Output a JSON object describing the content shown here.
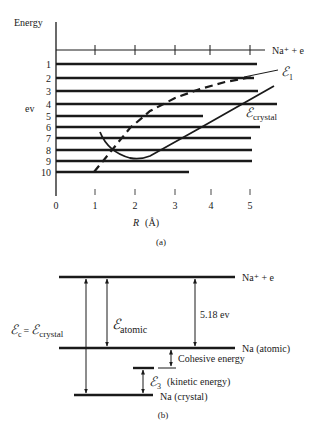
{
  "panel_a": {
    "y_axis_label": "Energy",
    "y_unit_label": "ev",
    "x_axis_label": "R",
    "x_axis_unit": "(Å)",
    "caption": "(a)",
    "top_level_label": "Na⁺ + e",
    "levels": [
      {
        "label": "1",
        "y": 64,
        "x_end": 257
      },
      {
        "label": "2",
        "y": 78,
        "x_end": 254
      },
      {
        "label": "3",
        "y": 91,
        "x_end": 258
      },
      {
        "label": "4",
        "y": 104,
        "x_end": 277
      },
      {
        "label": "5",
        "y": 116,
        "x_end": 203
      },
      {
        "label": "6",
        "y": 127,
        "x_end": 260
      },
      {
        "label": "7",
        "y": 138,
        "x_end": 251
      },
      {
        "label": "8",
        "y": 150,
        "x_end": 252
      },
      {
        "label": "9",
        "y": 161,
        "x_end": 252
      },
      {
        "label": "10",
        "y": 172,
        "x_end": 189
      }
    ],
    "x_ticks": [
      "0",
      "1",
      "2",
      "3",
      "4",
      "5"
    ],
    "curve_e1_label": "ℰ",
    "curve_e1_sub": "1",
    "curve_crystal_label": "ℰ",
    "curve_crystal_sub": "crystal"
  },
  "panel_b": {
    "caption": "(b)",
    "level_top": "Na⁺ + e",
    "level_atomic": "Na (atomic)",
    "level_crystal": "Na (crystal)",
    "ionization_value": "5.18 ev",
    "cohesive_label": "Cohesive energy",
    "e3_symbol": "ℰ",
    "e3_sub": "3",
    "e3_desc": "(kinetic energy)",
    "atomic_symbol": "ℰ",
    "atomic_sub": "atomic",
    "ec_symbol": "ℰ",
    "ec_sub": "c",
    "ec_eq": "=",
    "ec_crystal_symbol": "ℰ",
    "ec_crystal_sub": "crystal"
  }
}
